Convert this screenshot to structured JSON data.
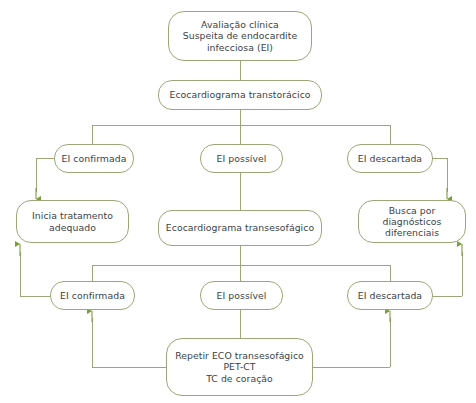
{
  "diagram": {
    "colors": {
      "line": "#9aa878",
      "arrow": "#7d9b3f",
      "text": "#3b3f4a",
      "background": "#ffffff"
    },
    "nodes": {
      "avaliacao_clinica": "Avaliação clínica\nSuspeita de endocardite\ninfecciosa (EI)",
      "eco_transtoracico": "Ecocardiograma transtorácico",
      "ei_confirmada_1": "EI confirmada",
      "ei_possivel_1": "EI possível",
      "ei_descartada_1": "EI descartada",
      "inicia_tratamento": "Inicia  tratamento\nadequado",
      "eco_transesofagico": "Ecocardiograma transesofágico",
      "busca_diagnosticos": "Busca por diagnósticos\ndiferenciais",
      "ei_confirmada_2": "EI confirmada",
      "ei_possivel_2": "EI possível",
      "ei_descartada_2": "EI descartada",
      "repetir_exames": "Repetir ECO transesofágico\nPET-CT\nTC de coração"
    }
  }
}
